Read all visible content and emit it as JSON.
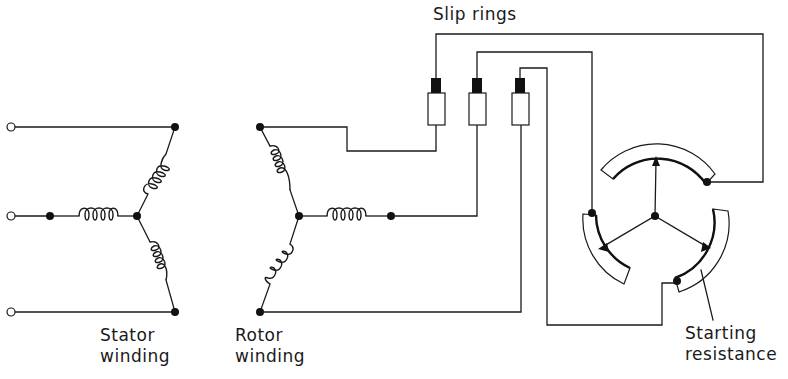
{
  "diagram": {
    "labels": {
      "slip_rings": "Slip rings",
      "stator_line1": "Stator",
      "stator_line2": "winding",
      "rotor_line1": "Rotor",
      "rotor_line2": "winding",
      "resistance_line1": "Starting",
      "resistance_line2": "resistance"
    },
    "components": {
      "stator": {
        "type": "star-connected winding",
        "phases": 3,
        "terminals": 3
      },
      "rotor": {
        "type": "star-connected winding",
        "phases": 3
      },
      "slip_rings": {
        "count": 3
      },
      "starting_resistance": {
        "type": "3-segment star-connected rheostat",
        "segments": 3
      }
    },
    "colors": {
      "line": "#1a1a1a",
      "background": "#ffffff"
    }
  }
}
